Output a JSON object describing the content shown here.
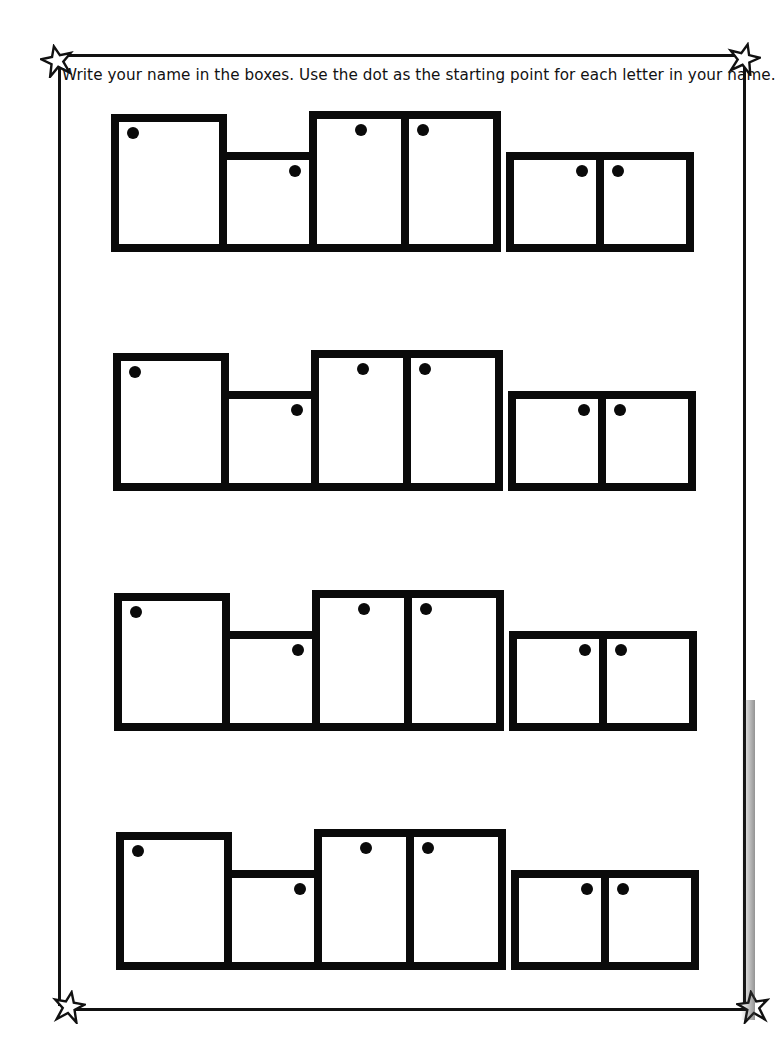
{
  "worksheet": {
    "instructions": "Write your name in the boxes. Use the dot as the starting point for each letter in your name.",
    "border_color": "#111111",
    "box_color": "#0a0a0a",
    "corner_decorations": [
      "star-icon",
      "star-icon",
      "star-icon",
      "star-icon"
    ],
    "row_count": 4,
    "box_pattern": [
      {
        "size": "tall",
        "dot": "top-left"
      },
      {
        "size": "short",
        "dot": "top-right"
      },
      {
        "size": "tall",
        "dot": "top-center"
      },
      {
        "size": "tall",
        "dot": "top-left"
      },
      {
        "size": "short",
        "dot": "top-right"
      },
      {
        "size": "short",
        "dot": "top-left"
      }
    ],
    "rows": [
      {
        "top": 114
      },
      {
        "top": 353
      },
      {
        "top": 593
      },
      {
        "top": 832
      }
    ]
  }
}
